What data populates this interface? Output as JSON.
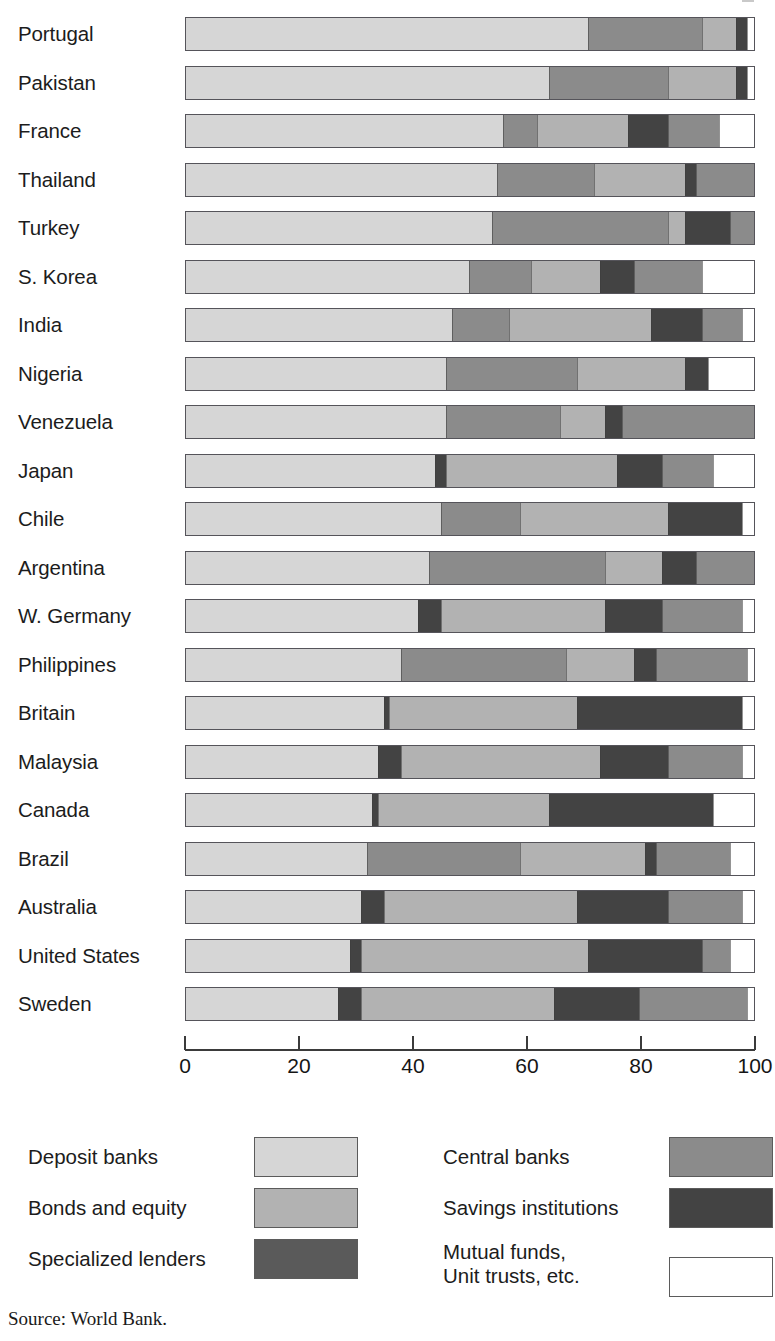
{
  "source_note": "Source: World Bank.",
  "palette": {
    "deposit_banks": "#d6d6d6",
    "bonds_and_equity": "#b2b2b2",
    "specialized_lenders": "#5a5a5a",
    "central_banks": "#8b8b8b",
    "savings_institutions": "#434343",
    "mutual_funds": "#ffffff"
  },
  "axis": {
    "ticks": [
      "0",
      "20",
      "40",
      "60",
      "80",
      "100"
    ],
    "min": 0,
    "max": 100
  },
  "legend": {
    "left": [
      {
        "label": "Deposit banks",
        "key": "deposit_banks"
      },
      {
        "label": "Bonds and equity",
        "key": "bonds_and_equity"
      },
      {
        "label": "Specialized lenders",
        "key": "specialized_lenders"
      }
    ],
    "right": [
      {
        "label": "Central banks",
        "key": "central_banks"
      },
      {
        "label": "Savings institutions",
        "key": "savings_institutions"
      },
      {
        "label": "Mutual funds,\nUnit trusts, etc.",
        "key": "mutual_funds"
      }
    ]
  },
  "chart_data": {
    "type": "bar",
    "orientation": "horizontal",
    "stacked": true,
    "title": "",
    "xlabel": "",
    "ylabel": "",
    "xlim": [
      0,
      100
    ],
    "grid": false,
    "legend_position": "bottom",
    "units": "percent of financial assets",
    "series": [
      {
        "name": "Deposit banks",
        "key": "deposit_banks"
      },
      {
        "name": "Central banks",
        "key": "central_banks"
      },
      {
        "name": "Bonds and equity",
        "key": "bonds_and_equity"
      },
      {
        "name": "Specialized lenders",
        "key": "specialized_lenders"
      },
      {
        "name": "Savings institutions",
        "key": "savings_institutions"
      },
      {
        "name": "Mutual funds, Unit trusts, etc.",
        "key": "mutual_funds"
      }
    ],
    "categories": [
      "Portugal",
      "Pakistan",
      "France",
      "Thailand",
      "Turkey",
      "S. Korea",
      "India",
      "Nigeria",
      "Venezuela",
      "Japan",
      "Chile",
      "Argentina",
      "W. Germany",
      "Philippines",
      "Britain",
      "Malaysia",
      "Canada",
      "Brazil",
      "Australia",
      "United States",
      "Sweden"
    ],
    "rows": [
      {
        "category": "Portugal",
        "segments": [
          {
            "key": "deposit_banks",
            "value": 71
          },
          {
            "key": "central_banks",
            "value": 20
          },
          {
            "key": "bonds_and_equity",
            "value": 6
          },
          {
            "key": "savings_institutions",
            "value": 2
          },
          {
            "key": "mutual_funds",
            "value": 1
          }
        ]
      },
      {
        "category": "Pakistan",
        "segments": [
          {
            "key": "deposit_banks",
            "value": 64
          },
          {
            "key": "central_banks",
            "value": 21
          },
          {
            "key": "bonds_and_equity",
            "value": 12
          },
          {
            "key": "savings_institutions",
            "value": 2
          },
          {
            "key": "mutual_funds",
            "value": 1
          }
        ]
      },
      {
        "category": "France",
        "segments": [
          {
            "key": "deposit_banks",
            "value": 56
          },
          {
            "key": "central_banks",
            "value": 6
          },
          {
            "key": "bonds_and_equity",
            "value": 16
          },
          {
            "key": "savings_institutions",
            "value": 7
          },
          {
            "key": "central_banks",
            "value": 9
          },
          {
            "key": "mutual_funds",
            "value": 6
          }
        ]
      },
      {
        "category": "Thailand",
        "segments": [
          {
            "key": "deposit_banks",
            "value": 55
          },
          {
            "key": "central_banks",
            "value": 17
          },
          {
            "key": "bonds_and_equity",
            "value": 16
          },
          {
            "key": "savings_institutions",
            "value": 2
          },
          {
            "key": "central_banks",
            "value": 10
          }
        ]
      },
      {
        "category": "Turkey",
        "segments": [
          {
            "key": "deposit_banks",
            "value": 54
          },
          {
            "key": "central_banks",
            "value": 31
          },
          {
            "key": "bonds_and_equity",
            "value": 3
          },
          {
            "key": "savings_institutions",
            "value": 8
          },
          {
            "key": "central_banks",
            "value": 4
          }
        ]
      },
      {
        "category": "S. Korea",
        "segments": [
          {
            "key": "deposit_banks",
            "value": 50
          },
          {
            "key": "central_banks",
            "value": 11
          },
          {
            "key": "bonds_and_equity",
            "value": 12
          },
          {
            "key": "savings_institutions",
            "value": 6
          },
          {
            "key": "central_banks",
            "value": 12
          },
          {
            "key": "mutual_funds",
            "value": 9
          }
        ]
      },
      {
        "category": "India",
        "segments": [
          {
            "key": "deposit_banks",
            "value": 47
          },
          {
            "key": "central_banks",
            "value": 10
          },
          {
            "key": "bonds_and_equity",
            "value": 25
          },
          {
            "key": "savings_institutions",
            "value": 9
          },
          {
            "key": "central_banks",
            "value": 7
          },
          {
            "key": "mutual_funds",
            "value": 2
          }
        ]
      },
      {
        "category": "Nigeria",
        "segments": [
          {
            "key": "deposit_banks",
            "value": 46
          },
          {
            "key": "central_banks",
            "value": 23
          },
          {
            "key": "bonds_and_equity",
            "value": 19
          },
          {
            "key": "savings_institutions",
            "value": 4
          },
          {
            "key": "mutual_funds",
            "value": 8
          }
        ]
      },
      {
        "category": "Venezuela",
        "segments": [
          {
            "key": "deposit_banks",
            "value": 46
          },
          {
            "key": "central_banks",
            "value": 20
          },
          {
            "key": "bonds_and_equity",
            "value": 8
          },
          {
            "key": "savings_institutions",
            "value": 3
          },
          {
            "key": "central_banks",
            "value": 23
          }
        ]
      },
      {
        "category": "Japan",
        "segments": [
          {
            "key": "deposit_banks",
            "value": 44
          },
          {
            "key": "savings_institutions",
            "value": 2
          },
          {
            "key": "bonds_and_equity",
            "value": 30
          },
          {
            "key": "savings_institutions",
            "value": 8
          },
          {
            "key": "central_banks",
            "value": 9
          },
          {
            "key": "mutual_funds",
            "value": 7
          }
        ]
      },
      {
        "category": "Chile",
        "segments": [
          {
            "key": "deposit_banks",
            "value": 45
          },
          {
            "key": "central_banks",
            "value": 14
          },
          {
            "key": "bonds_and_equity",
            "value": 26
          },
          {
            "key": "savings_institutions",
            "value": 13
          },
          {
            "key": "mutual_funds",
            "value": 2
          }
        ]
      },
      {
        "category": "Argentina",
        "segments": [
          {
            "key": "deposit_banks",
            "value": 43
          },
          {
            "key": "central_banks",
            "value": 31
          },
          {
            "key": "bonds_and_equity",
            "value": 10
          },
          {
            "key": "savings_institutions",
            "value": 6
          },
          {
            "key": "central_banks",
            "value": 10
          }
        ]
      },
      {
        "category": "W. Germany",
        "segments": [
          {
            "key": "deposit_banks",
            "value": 41
          },
          {
            "key": "savings_institutions",
            "value": 4
          },
          {
            "key": "bonds_and_equity",
            "value": 29
          },
          {
            "key": "savings_institutions",
            "value": 10
          },
          {
            "key": "central_banks",
            "value": 14
          },
          {
            "key": "mutual_funds",
            "value": 2
          }
        ]
      },
      {
        "category": "Philippines",
        "segments": [
          {
            "key": "deposit_banks",
            "value": 38
          },
          {
            "key": "central_banks",
            "value": 29
          },
          {
            "key": "bonds_and_equity",
            "value": 12
          },
          {
            "key": "savings_institutions",
            "value": 4
          },
          {
            "key": "central_banks",
            "value": 16
          },
          {
            "key": "mutual_funds",
            "value": 1
          }
        ]
      },
      {
        "category": "Britain",
        "segments": [
          {
            "key": "deposit_banks",
            "value": 35
          },
          {
            "key": "savings_institutions",
            "value": 1
          },
          {
            "key": "bonds_and_equity",
            "value": 33
          },
          {
            "key": "savings_institutions",
            "value": 29
          },
          {
            "key": "mutual_funds",
            "value": 2
          }
        ]
      },
      {
        "category": "Malaysia",
        "segments": [
          {
            "key": "deposit_banks",
            "value": 34
          },
          {
            "key": "savings_institutions",
            "value": 4
          },
          {
            "key": "bonds_and_equity",
            "value": 35
          },
          {
            "key": "savings_institutions",
            "value": 12
          },
          {
            "key": "central_banks",
            "value": 13
          },
          {
            "key": "mutual_funds",
            "value": 2
          }
        ]
      },
      {
        "category": "Canada",
        "segments": [
          {
            "key": "deposit_banks",
            "value": 33
          },
          {
            "key": "savings_institutions",
            "value": 1
          },
          {
            "key": "bonds_and_equity",
            "value": 30
          },
          {
            "key": "savings_institutions",
            "value": 29
          },
          {
            "key": "mutual_funds",
            "value": 7
          }
        ]
      },
      {
        "category": "Brazil",
        "segments": [
          {
            "key": "deposit_banks",
            "value": 32
          },
          {
            "key": "central_banks",
            "value": 27
          },
          {
            "key": "bonds_and_equity",
            "value": 22
          },
          {
            "key": "savings_institutions",
            "value": 2
          },
          {
            "key": "central_banks",
            "value": 13
          },
          {
            "key": "mutual_funds",
            "value": 4
          }
        ]
      },
      {
        "category": "Australia",
        "segments": [
          {
            "key": "deposit_banks",
            "value": 31
          },
          {
            "key": "savings_institutions",
            "value": 4
          },
          {
            "key": "bonds_and_equity",
            "value": 34
          },
          {
            "key": "savings_institutions",
            "value": 16
          },
          {
            "key": "central_banks",
            "value": 13
          },
          {
            "key": "mutual_funds",
            "value": 2
          }
        ]
      },
      {
        "category": "United States",
        "segments": [
          {
            "key": "deposit_banks",
            "value": 29
          },
          {
            "key": "savings_institutions",
            "value": 2
          },
          {
            "key": "bonds_and_equity",
            "value": 40
          },
          {
            "key": "savings_institutions",
            "value": 20
          },
          {
            "key": "central_banks",
            "value": 5
          },
          {
            "key": "mutual_funds",
            "value": 4
          }
        ]
      },
      {
        "category": "Sweden",
        "segments": [
          {
            "key": "deposit_banks",
            "value": 27
          },
          {
            "key": "savings_institutions",
            "value": 4
          },
          {
            "key": "bonds_and_equity",
            "value": 34
          },
          {
            "key": "savings_institutions",
            "value": 15
          },
          {
            "key": "central_banks",
            "value": 19
          },
          {
            "key": "mutual_funds",
            "value": 1
          }
        ]
      }
    ]
  }
}
